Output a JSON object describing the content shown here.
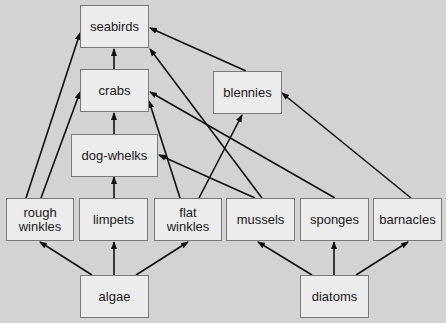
{
  "diagram": {
    "type": "food-web",
    "colors": {
      "background": "#d3d3d3",
      "node_fill": "#ececec",
      "node_border": "#7a7a7a",
      "arrow": "#111111"
    },
    "nodes": [
      {
        "id": "seabirds",
        "label": "seabirds",
        "x": 80,
        "y": 5,
        "w": 69,
        "h": 43
      },
      {
        "id": "crabs",
        "label": "crabs",
        "x": 80,
        "y": 69,
        "w": 69,
        "h": 43
      },
      {
        "id": "blennies",
        "label": "blennies",
        "x": 213,
        "y": 71,
        "w": 69,
        "h": 43
      },
      {
        "id": "dog-whelks",
        "label": "dog-whelks",
        "x": 71,
        "y": 134,
        "w": 87,
        "h": 43
      },
      {
        "id": "rough-winkles",
        "label": "rough\nwinkles",
        "x": 6,
        "y": 198,
        "w": 68,
        "h": 43
      },
      {
        "id": "limpets",
        "label": "limpets",
        "x": 79,
        "y": 198,
        "w": 69,
        "h": 43
      },
      {
        "id": "flat-winkles",
        "label": "flat\nwinkles",
        "x": 154,
        "y": 198,
        "w": 68,
        "h": 43
      },
      {
        "id": "mussels",
        "label": "mussels",
        "x": 226,
        "y": 198,
        "w": 69,
        "h": 43
      },
      {
        "id": "sponges",
        "label": "sponges",
        "x": 300,
        "y": 198,
        "w": 69,
        "h": 43
      },
      {
        "id": "barnacles",
        "label": "barnacles",
        "x": 373,
        "y": 198,
        "w": 69,
        "h": 43
      },
      {
        "id": "algae",
        "label": "algae",
        "x": 80,
        "y": 275,
        "w": 69,
        "h": 43
      },
      {
        "id": "diatoms",
        "label": "diatoms",
        "x": 300,
        "y": 275,
        "w": 69,
        "h": 43
      }
    ],
    "edges": [
      {
        "from": "crabs",
        "to": "seabirds",
        "x1": 114,
        "y1": 69,
        "x2": 114,
        "y2": 49
      },
      {
        "from": "blennies",
        "to": "seabirds",
        "x1": 246,
        "y1": 71,
        "x2": 150,
        "y2": 28
      },
      {
        "from": "mussels",
        "to": "seabirds",
        "x1": 262,
        "y1": 198,
        "x2": 150,
        "y2": 49
      },
      {
        "from": "rough-winkles",
        "to": "seabirds",
        "x1": 26,
        "y1": 198,
        "x2": 80,
        "y2": 33
      },
      {
        "from": "dog-whelks",
        "to": "crabs",
        "x1": 114,
        "y1": 134,
        "x2": 114,
        "y2": 113
      },
      {
        "from": "rough-winkles",
        "to": "crabs",
        "x1": 41,
        "y1": 198,
        "x2": 80,
        "y2": 92
      },
      {
        "from": "sponges",
        "to": "crabs",
        "x1": 335,
        "y1": 198,
        "x2": 150,
        "y2": 92
      },
      {
        "from": "flat-winkles",
        "to": "crabs",
        "x1": 180,
        "y1": 198,
        "x2": 149,
        "y2": 101
      },
      {
        "from": "flat-winkles",
        "to": "blennies",
        "x1": 199,
        "y1": 198,
        "x2": 242,
        "y2": 115
      },
      {
        "from": "barnacles",
        "to": "blennies",
        "x1": 411,
        "y1": 198,
        "x2": 282,
        "y2": 93
      },
      {
        "from": "limpets",
        "to": "dog-whelks",
        "x1": 114,
        "y1": 198,
        "x2": 114,
        "y2": 177
      },
      {
        "from": "mussels",
        "to": "dog-whelks",
        "x1": 255,
        "y1": 198,
        "x2": 159,
        "y2": 155
      },
      {
        "from": "algae",
        "to": "rough-winkles",
        "x1": 92,
        "y1": 275,
        "x2": 40,
        "y2": 242
      },
      {
        "from": "algae",
        "to": "limpets",
        "x1": 114,
        "y1": 275,
        "x2": 114,
        "y2": 242
      },
      {
        "from": "algae",
        "to": "flat-winkles",
        "x1": 136,
        "y1": 275,
        "x2": 188,
        "y2": 242
      },
      {
        "from": "diatoms",
        "to": "mussels",
        "x1": 312,
        "y1": 275,
        "x2": 258,
        "y2": 242
      },
      {
        "from": "diatoms",
        "to": "sponges",
        "x1": 334,
        "y1": 275,
        "x2": 334,
        "y2": 242
      },
      {
        "from": "diatoms",
        "to": "barnacles",
        "x1": 356,
        "y1": 275,
        "x2": 408,
        "y2": 242
      }
    ]
  }
}
